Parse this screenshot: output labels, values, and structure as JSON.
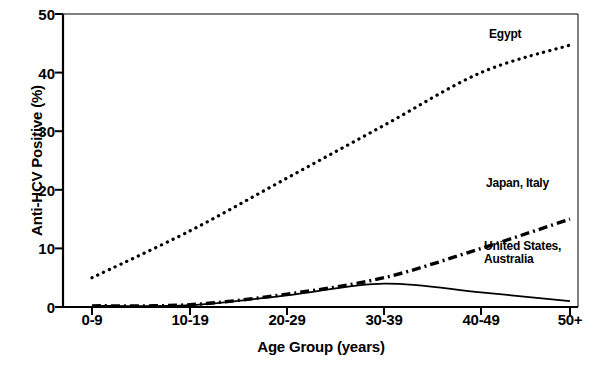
{
  "chart_data": {
    "type": "line",
    "title": "",
    "subtitle": "",
    "xlabel": "Age Group (years)",
    "ylabel": "Anti-HCV Positive (%)",
    "categories": [
      "0-9",
      "10-19",
      "20-29",
      "30-39",
      "40-49",
      "50+"
    ],
    "ylim": [
      0,
      50
    ],
    "yticks": [
      0,
      10,
      20,
      30,
      40,
      50
    ],
    "ytick_labels": [
      "0",
      "10",
      "20",
      "30",
      "40",
      "50"
    ],
    "grid": false,
    "legend_position": "inline-annotations",
    "series": [
      {
        "name": "Egypt",
        "style": "dotted",
        "color": "#000000",
        "values": [
          5,
          13,
          22,
          31,
          40,
          44.7
        ]
      },
      {
        "name": "Japan, Italy",
        "style": "dash-dot",
        "color": "#000000",
        "values": [
          0.2,
          0.4,
          2.2,
          5,
          10,
          15
        ]
      },
      {
        "name": "United States, Australia",
        "style": "solid",
        "color": "#000000",
        "values": [
          0.2,
          0.3,
          2,
          4,
          2.5,
          1
        ]
      }
    ],
    "annotations": [
      {
        "text": "Egypt",
        "series": "Egypt"
      },
      {
        "text": "Japan, Italy",
        "series": "Japan, Italy"
      },
      {
        "text": "United States,\nAustralia",
        "series": "United States, Australia"
      }
    ]
  }
}
